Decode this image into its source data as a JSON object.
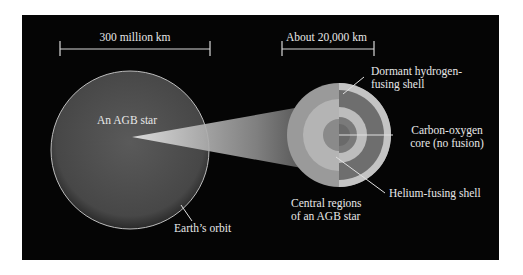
{
  "diagram": {
    "scale_bars": {
      "star": "300 million km",
      "core": "About 20,000 km"
    },
    "labels": {
      "star": "An AGB star",
      "earth_orbit": "Earth’s orbit",
      "core_region": [
        "Central regions",
        "of an AGB star"
      ],
      "hydrogen_shell": [
        "Dormant hydrogen-",
        "fusing shell"
      ],
      "co_core": [
        "Carbon-oxygen",
        "core (no fusion)"
      ],
      "helium_shell": "Helium-fusing shell"
    },
    "colors": {
      "background": "#050505",
      "star": "#4a4a4a",
      "orbit": "#bdbdbd",
      "outer_envelope": "#9a9a9a",
      "hydrogen_shell": "#6e6e6e",
      "helium_region": "#b4b4b4",
      "core": "#8a8a8a",
      "text": "#e8e8e8"
    }
  }
}
